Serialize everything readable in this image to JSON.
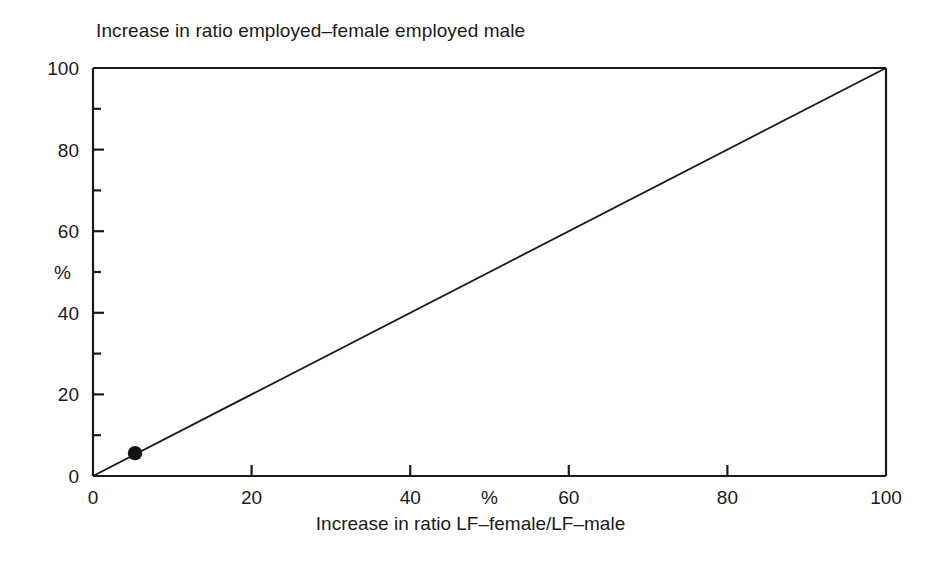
{
  "chart_data": {
    "type": "scatter",
    "title": "Increase in ratio employed–female employed male",
    "xlabel": "Increase in ratio LF–female/LF–male",
    "ylabel": "%",
    "x_axis_unit_label": "%",
    "xlim": [
      0,
      100
    ],
    "ylim": [
      0,
      100
    ],
    "grid": false,
    "legend": "none",
    "x_ticks": [
      0,
      20,
      40,
      60,
      80,
      100
    ],
    "x_tick_labels": [
      "0",
      "20",
      "40",
      "60",
      "80",
      "100"
    ],
    "x_minor_ticks": [
      10,
      30,
      50,
      70,
      90
    ],
    "y_ticks": [
      0,
      20,
      40,
      60,
      80,
      100
    ],
    "y_tick_labels": [
      "0",
      "20",
      "40",
      "60",
      "80",
      "100"
    ],
    "y_minor_ticks": [
      10,
      30,
      50,
      70,
      90
    ],
    "reference_line": {
      "description": "45 degree line",
      "from": [
        0,
        0
      ],
      "to": [
        100,
        100
      ]
    },
    "points": [
      {
        "label": "JA",
        "x": 5.3,
        "y": 5.6,
        "label_dx": 6,
        "label_dy": 22
      },
      {
        "label": "AU",
        "x": 8.5,
        "y": 8.8,
        "label_dx": -8,
        "label_dy": -12
      },
      {
        "label": "FN",
        "x": 13.2,
        "y": 12.8,
        "label_dx": -6,
        "label_dy": 24
      },
      {
        "label": "SZ",
        "x": 19.2,
        "y": 19.1,
        "label_dx": -8,
        "label_dy": -14
      },
      {
        "label": "GE",
        "x": 22.1,
        "y": 19.4,
        "label_dx": -6,
        "label_dy": 25
      },
      {
        "label": "OECD",
        "x": 30.8,
        "y": 30.1,
        "label_dx": -64,
        "label_dy": -3
      },
      {
        "label": "IR",
        "x": 32.2,
        "y": 36.6,
        "label_dx": -34,
        "label_dy": 4
      },
      {
        "label": "US",
        "x": 34.1,
        "y": 37.0,
        "label_dx": -12,
        "label_dy": -44
      },
      {
        "label": "DK",
        "x": 33.4,
        "y": 29.7,
        "label_dx": -12,
        "label_dy": 50
      },
      {
        "label": "FR",
        "x": 35.6,
        "y": 29.9,
        "label_dx": 4,
        "label_dy": 34
      },
      {
        "label": "UK",
        "x": 36.2,
        "y": 38.2,
        "label_dx": 4,
        "label_dy": -16
      },
      {
        "label": "EC",
        "x": 37.7,
        "y": 31.6,
        "label_dx": 14,
        "label_dy": 8
      },
      {
        "label": "SW",
        "x": 41.4,
        "y": 41.4,
        "label_dx": -40,
        "label_dy": -18
      },
      {
        "label": "AL",
        "x": 44.8,
        "y": 47.3,
        "label_dx": 0,
        "label_dy": -18
      },
      {
        "label": "LX",
        "x": 44.2,
        "y": 41.4,
        "label_dx": 12,
        "label_dy": 7
      },
      {
        "label": "IT",
        "x": 44.2,
        "y": 35.8,
        "label_dx": -4,
        "label_dy": 27
      },
      {
        "label": "BE",
        "x": 49.4,
        "y": 38.5,
        "label_dx": 14,
        "label_dy": 7
      },
      {
        "label": "CA",
        "x": 59.6,
        "y": 59.6,
        "label_dx": -10,
        "label_dy": -16
      },
      {
        "label": "SP",
        "x": 66.6,
        "y": 43.2,
        "label_dx": 14,
        "label_dy": 7
      },
      {
        "label": "NW",
        "x": 88.0,
        "y": 90.0,
        "label_dx": -62,
        "label_dy": 10
      },
      {
        "label": "NZ",
        "x": 88.0,
        "y": 90.0,
        "label_dx": 6,
        "label_dy": -18
      }
    ],
    "colors": {
      "point": "#111111",
      "axis": "#1a1a1a",
      "reference_line": "#1a1a1a",
      "background": "#ffffff"
    }
  }
}
